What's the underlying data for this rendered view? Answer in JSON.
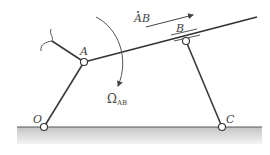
{
  "diagram": {
    "type": "mechanism",
    "colors": {
      "link": "#3a3a3a",
      "ground_line": "#555555",
      "ground_fill_top": "#c8c8c8",
      "ground_fill_bottom": "#f2f2f2",
      "pin_fill": "#ffffff",
      "label": "#444444"
    },
    "labels": {
      "A": "A",
      "B": "B",
      "O": "O",
      "C": "C",
      "velocity_label_dot": "A",
      "velocity_label_rest": "B",
      "omega_symbol": "Ω",
      "omega_subscript": "AB"
    },
    "points": {
      "A": [
        84,
        62
      ],
      "B": [
        186,
        41
      ],
      "O": [
        44,
        127
      ],
      "C": [
        222,
        127
      ]
    },
    "members": [
      {
        "name": "link-OA",
        "from": "O",
        "to": "A"
      },
      {
        "name": "link-AB-bar",
        "from": [
          84,
          62
        ],
        "to": [
          257,
          17
        ]
      },
      {
        "name": "link-CB",
        "from": "C",
        "to": "B"
      },
      {
        "name": "link-A-broken",
        "from": [
          84,
          62
        ],
        "to": [
          52,
          41
        ]
      }
    ]
  }
}
